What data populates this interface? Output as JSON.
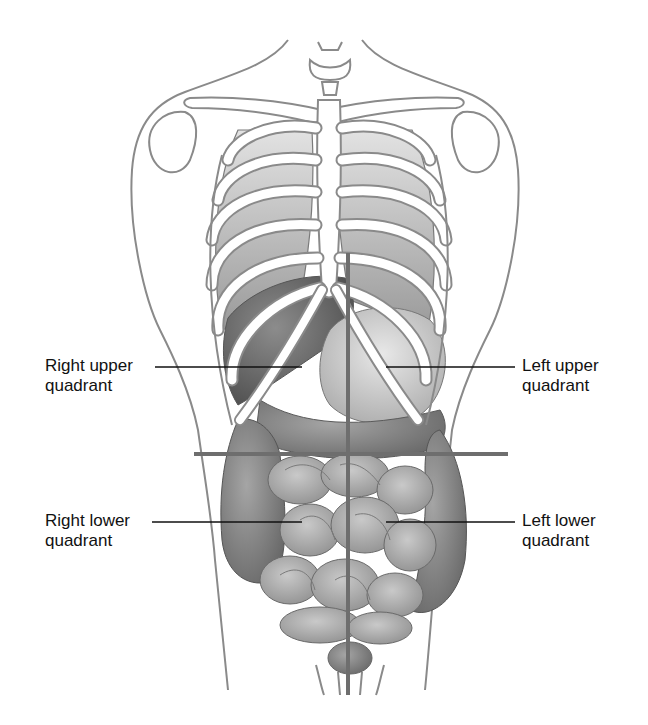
{
  "diagram": {
    "labels": {
      "right_upper": {
        "line1": "Right upper",
        "line2": "quadrant"
      },
      "left_upper": {
        "line1": "Left upper",
        "line2": "quadrant"
      },
      "right_lower": {
        "line1": "Right lower",
        "line2": "quadrant"
      },
      "left_lower": {
        "line1": "Left lower",
        "line2": "quadrant"
      }
    },
    "colors": {
      "outline": "#8a8a8a",
      "divider": "#6e6e6e",
      "leader": "#111111",
      "organ_dark": "#6a6a6a",
      "organ_mid": "#9a9a9a",
      "organ_light": "#c8c8c8",
      "bone": "#ffffff"
    }
  }
}
